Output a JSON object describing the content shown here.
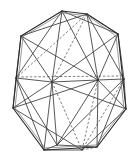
{
  "figure": {
    "kind": "polyhedron-line-drawing",
    "name": "icosahedron",
    "caption": "",
    "width": 139,
    "height": 158,
    "background_color": "#ffffff",
    "visible_edge_color": "#3a3a3a",
    "silhouette_edge_color": "#2b2b2b",
    "hidden_edge_color": "#5d5d5d",
    "hidden_edge_style": "dashed",
    "visible_edge_style": "solid"
  },
  "geometry": {
    "vertices": {
      "apex_top_left": [
        62,
        11
      ],
      "apex_top_right": [
        87,
        14
      ],
      "hex_top_left": [
        21,
        36
      ],
      "hex_top_right": [
        118,
        34
      ],
      "hex_right": [
        126,
        109
      ],
      "hex_left": [
        13,
        108
      ],
      "hex_bottom_right": [
        97,
        147
      ],
      "hex_bottom_left": [
        44,
        150
      ],
      "mid_left": [
        16,
        78
      ],
      "mid_right": [
        124,
        79
      ],
      "band_left": [
        52,
        82
      ],
      "band_right": [
        98,
        80
      ],
      "band_dash_left": [
        17,
        77
      ],
      "band_dash_right": [
        122,
        76
      ],
      "apex_bottom_left": [
        57,
        145
      ],
      "apex_bottom_right": [
        82,
        150
      ]
    },
    "outline_polygon": [
      [
        62,
        11
      ],
      [
        87,
        14
      ],
      [
        118,
        34
      ],
      [
        126,
        109
      ],
      [
        97,
        147
      ],
      [
        44,
        150
      ],
      [
        13,
        108
      ],
      [
        21,
        36
      ]
    ]
  },
  "edges": {
    "silhouette": [
      {
        "from": "apex_top_left",
        "to": "apex_top_right"
      },
      {
        "from": "apex_top_right",
        "to": "hex_top_right"
      },
      {
        "from": "hex_top_right",
        "to": "hex_right"
      },
      {
        "from": "hex_right",
        "to": "hex_bottom_right"
      },
      {
        "from": "hex_bottom_right",
        "to": "hex_bottom_left"
      },
      {
        "from": "hex_bottom_left",
        "to": "hex_left"
      },
      {
        "from": "hex_left",
        "to": "hex_top_left"
      },
      {
        "from": "hex_top_left",
        "to": "apex_top_left"
      }
    ],
    "visible_count": 22,
    "hidden_count": 8
  },
  "labels": {
    "vertex_labels": [],
    "annotations": []
  }
}
